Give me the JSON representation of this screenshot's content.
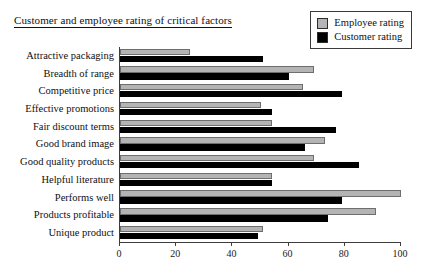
{
  "chart_data": {
    "type": "bar",
    "orientation": "horizontal",
    "title": "Customer and employee rating of critical factors",
    "xlabel": "",
    "ylabel": "",
    "xlim": [
      0,
      100
    ],
    "xticks": [
      0,
      20,
      40,
      60,
      80,
      100
    ],
    "grid": false,
    "legend_position": "top-right",
    "categories": [
      "Attractive packaging",
      "Breadth of range",
      "Competitive price",
      "Effective promotions",
      "Fair discount terms",
      "Good brand image",
      "Good quality products",
      "Helpful literature",
      "Performs well",
      "Products profitable",
      "Unique product"
    ],
    "series": [
      {
        "name": "Employee rating",
        "color": "#b4b4b4",
        "values": [
          25,
          69,
          65,
          50,
          54,
          73,
          69,
          54,
          100,
          91,
          51
        ]
      },
      {
        "name": "Customer rating",
        "color": "#000000",
        "values": [
          51,
          60,
          79,
          54,
          77,
          66,
          85,
          54,
          79,
          74,
          49
        ]
      }
    ]
  },
  "legend": {
    "items": [
      {
        "label": "Employee rating",
        "swatch_name": "employee-rating-swatch"
      },
      {
        "label": "Customer rating",
        "swatch_name": "customer-rating-swatch"
      }
    ]
  }
}
